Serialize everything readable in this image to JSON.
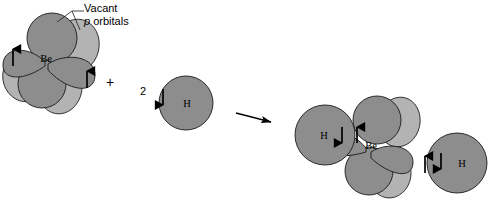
{
  "figure": {
    "type": "chemical-reaction-diagram",
    "background_color": "#ffffff"
  },
  "palette": {
    "lobe_front": "#8d8d8d",
    "lobe_back": "#b3b3b3",
    "atom_fill": "#8d8d8d",
    "outline": "#1a1a1a",
    "arrow": "#000000",
    "text": "#000000"
  },
  "annotations": {
    "vacant_label_line1": "Vacant",
    "vacant_label_italic": "p",
    "vacant_label_line2": " orbitals"
  },
  "reactants": {
    "beryllium": {
      "center_label": "Be",
      "hybrid_orbitals": [
        {
          "id": "sp-left",
          "electron_spin": "up",
          "occupied": true
        },
        {
          "id": "sp-right",
          "electron_spin": "up",
          "occupied": true
        }
      ],
      "vacant_p_orbitals": [
        {
          "id": "p-top",
          "occupied": false
        },
        {
          "id": "p-bottom",
          "occupied": false
        }
      ]
    },
    "plus_sign": "+",
    "hydrogen": {
      "coefficient": "2",
      "label": "H",
      "electron_spin": "down"
    }
  },
  "reaction_arrow": {
    "direction": "right"
  },
  "product": {
    "center_label": "Be",
    "hydrogens": [
      {
        "label": "H",
        "side": "left",
        "electron_spin": "down"
      },
      {
        "label": "H",
        "side": "right",
        "electron_spin": "down"
      }
    ],
    "bond_pairs": [
      {
        "side": "left",
        "spins": [
          "down",
          "up"
        ]
      },
      {
        "side": "right",
        "spins": [
          "up",
          "down"
        ]
      }
    ],
    "vacant_p_orbitals": [
      {
        "id": "p-top",
        "occupied": false
      },
      {
        "id": "p-bottom",
        "occupied": false
      }
    ]
  }
}
